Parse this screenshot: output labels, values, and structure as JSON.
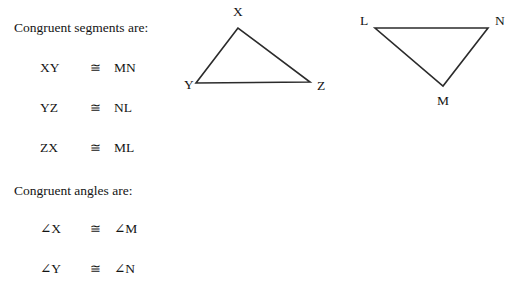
{
  "document": {
    "title": "Congruent segments and angles of triangles XYZ and LMN"
  },
  "sections": {
    "segments": {
      "heading": "Congruent segments are:",
      "rows": [
        {
          "left": "XY",
          "symbol": "≅",
          "right": "MN"
        },
        {
          "left": "YZ",
          "symbol": "≅",
          "right": "NL"
        },
        {
          "left": "ZX",
          "symbol": "≅",
          "right": "ML"
        }
      ]
    },
    "angles": {
      "heading": "Congruent angles are:",
      "rows": [
        {
          "left": "∠X",
          "symbol": "≅",
          "right": "∠M"
        },
        {
          "left": "∠Y",
          "symbol": "≅",
          "right": "∠N"
        }
      ]
    }
  },
  "figures": {
    "stroke_color": "#2b2b2b",
    "label_color": "#141414",
    "triangles": [
      {
        "name": "triangle-xyz",
        "vertices": [
          {
            "label": "X",
            "x": 58,
            "y": 28,
            "label_x": 53,
            "label_y": 16
          },
          {
            "label": "Y",
            "x": 16,
            "y": 83,
            "label_x": 4,
            "label_y": 89
          },
          {
            "label": "Z",
            "x": 130,
            "y": 82,
            "label_x": 137,
            "label_y": 90
          }
        ],
        "polygon": "58,28 16,83 130,82"
      },
      {
        "name": "triangle-lmn",
        "vertices": [
          {
            "label": "L",
            "x": 195,
            "y": 28,
            "label_x": 180,
            "label_y": 25
          },
          {
            "label": "M",
            "x": 263,
            "y": 86,
            "label_x": 257,
            "label_y": 105
          },
          {
            "label": "N",
            "x": 308,
            "y": 28,
            "label_x": 315,
            "label_y": 25
          }
        ],
        "polygon": "195,28 308,28 263,86"
      }
    ]
  }
}
